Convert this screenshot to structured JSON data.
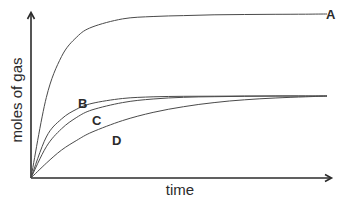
{
  "chart_data": {
    "type": "line",
    "title": "",
    "xlabel": "time",
    "ylabel": "moles of gas",
    "grid": false,
    "legend": "inline labels at curve ends / alongside curves",
    "axis_ticks": "none (qualitative sketch)",
    "xlim": [
      0,
      10
    ],
    "ylim": [
      0,
      10
    ],
    "x": [
      0,
      0.5,
      1,
      1.5,
      2,
      3,
      4,
      5,
      6,
      7,
      8,
      9,
      9.7
    ],
    "series": [
      {
        "name": "A",
        "label": "A",
        "plateau": 10,
        "description": "fastest initial rate, highest final amount",
        "values": [
          0,
          4.9,
          7.4,
          8.6,
          9.2,
          9.7,
          9.85,
          9.9,
          9.95,
          9.97,
          9.98,
          9.99,
          10
        ]
      },
      {
        "name": "B",
        "label": "B",
        "plateau": 5,
        "description": "fast initial rate, reaches same final amount as C and D",
        "values": [
          0,
          2.5,
          3.6,
          4.2,
          4.55,
          4.85,
          4.95,
          4.98,
          4.99,
          5,
          5,
          5,
          5
        ]
      },
      {
        "name": "C",
        "label": "C",
        "plateau": 5,
        "description": "medium initial rate, same final amount as B",
        "values": [
          0,
          1.9,
          3.0,
          3.7,
          4.15,
          4.6,
          4.82,
          4.92,
          4.96,
          4.98,
          5,
          5,
          5
        ]
      },
      {
        "name": "D",
        "label": "D",
        "plateau": 5,
        "description": "slowest initial rate, approaches same final amount",
        "values": [
          0,
          0.9,
          1.7,
          2.3,
          2.8,
          3.5,
          4.0,
          4.35,
          4.6,
          4.77,
          4.88,
          4.95,
          5
        ]
      }
    ]
  },
  "labels": {
    "xlabel": "time",
    "ylabel": "moles of gas",
    "curve_a": "A",
    "curve_b": "B",
    "curve_c": "C",
    "curve_d": "D"
  },
  "colors": {
    "axis": "#2b2b2b",
    "curve": "#4a4a4a",
    "background": "#ffffff"
  }
}
